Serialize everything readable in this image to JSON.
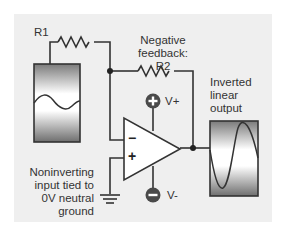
{
  "diagram": {
    "labels": {
      "r1": "R1",
      "feedback": [
        "Negative",
        "feedback: R2"
      ],
      "output": [
        "Inverted",
        "linear",
        "output"
      ],
      "noninverting": [
        "Noninverting",
        "input tied to",
        "0V neutral",
        "ground"
      ],
      "vplus": "V+",
      "vminus": "V-",
      "minus_input": "−",
      "plus_input": "+"
    },
    "components": [
      {
        "id": "R1",
        "type": "resistor",
        "role": "input resistor"
      },
      {
        "id": "R2",
        "type": "resistor",
        "role": "negative feedback"
      },
      {
        "id": "opamp",
        "type": "operational amplifier"
      },
      {
        "id": "input_signal",
        "type": "sine source",
        "amplitude": "small"
      },
      {
        "id": "output_signal",
        "type": "sine display",
        "amplitude": "large, inverted"
      },
      {
        "id": "ground",
        "type": "ground",
        "label": "0V neutral ground"
      }
    ],
    "colors": {
      "panel": "#efefef",
      "wire": "#333333",
      "supply_icon": "#4a4a4a"
    }
  }
}
